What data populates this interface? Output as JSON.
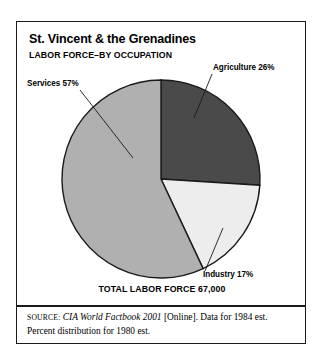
{
  "card": {
    "title": "St. Vincent & the Grenadines",
    "subtitle": "LABOR FORCE–BY OCCUPATION",
    "total_caption": "TOTAL LABOR FORCE 67,000",
    "source": {
      "kicker": "SOURCE:",
      "publication": "CIA World Factbook 2001",
      "rest": " [Online]. Data for 1984 est. Percent distribution for 1980 est."
    }
  },
  "labels": {
    "agriculture": "Agriculture 26%",
    "services": "Services 57%",
    "industry": "Industry 17%"
  },
  "colors": {
    "agriculture": "#4a4a4a",
    "services": "#b0b0b0",
    "industry": "#ededed",
    "outline": "#1a1a1a",
    "frame": "#1a1a1a",
    "text": "#000000"
  },
  "chart_data": {
    "type": "pie",
    "title": "St. Vincent & the Grenadines",
    "subtitle": "LABOR FORCE–BY OCCUPATION",
    "categories": [
      "Agriculture",
      "Industry",
      "Services"
    ],
    "values": [
      26,
      17,
      57
    ],
    "value_unit": "percent",
    "labels": [
      "Agriculture 26%",
      "Industry 17%",
      "Services 57%"
    ],
    "colors": [
      "#4a4a4a",
      "#ededed",
      "#b0b0b0"
    ],
    "start_angle_deg": 0,
    "direction": "clockwise",
    "total_label": "TOTAL LABOR FORCE 67,000",
    "total_value": 67000,
    "legend": "none",
    "grid": false,
    "annotations": [
      "Agriculture 26%",
      "Industry 17%",
      "Services 57%",
      "TOTAL LABOR FORCE 67,000"
    ]
  }
}
